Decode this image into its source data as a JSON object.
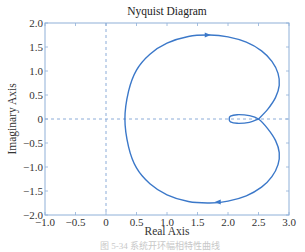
{
  "chart_data": {
    "type": "line",
    "title": "Nyquist Diagram",
    "xlabel": "Real Axis",
    "ylabel": "Imaginary Axis",
    "xlim": [
      -1.0,
      3.0
    ],
    "ylim": [
      -2.0,
      2.0
    ],
    "xticks": [
      -1.0,
      -0.5,
      0,
      0.5,
      1.0,
      1.5,
      2.0,
      2.5,
      3.0
    ],
    "xtick_labels": [
      "−1.0",
      "−0.5",
      "0",
      "0.5",
      "1.0",
      "1.5",
      "2.0",
      "2.5",
      "3.0"
    ],
    "yticks": [
      2.0,
      1.5,
      1.0,
      0.5,
      0,
      -0.5,
      -1.0,
      -1.5,
      -2.0
    ],
    "ytick_labels": [
      "2.0",
      "1.5",
      "1.0",
      "0.5",
      "0",
      "−0.5",
      "−1.0",
      "−1.5",
      "−2.0"
    ],
    "grid": false,
    "reference_lines": [
      {
        "orientation": "vertical",
        "value": 0,
        "style": "dashed"
      },
      {
        "orientation": "horizontal",
        "value": 0,
        "style": "dashed"
      }
    ],
    "series": [
      {
        "name": "Nyquist curve",
        "color": "#3b78c9",
        "x": [
          2.5,
          2.65,
          2.78,
          2.84,
          2.82,
          2.72,
          2.55,
          2.3,
          2.0,
          1.7,
          1.35,
          1.0,
          0.72,
          0.5,
          0.37,
          0.31,
          0.37,
          0.5,
          0.72,
          1.0,
          1.35,
          1.7,
          2.0,
          2.3,
          2.55,
          2.72,
          2.82,
          2.84,
          2.78,
          2.65,
          2.5,
          2.35,
          2.15,
          2.04,
          2.02,
          2.04,
          2.15,
          2.35,
          2.5
        ],
        "y": [
          0.0,
          0.2,
          0.45,
          0.7,
          0.95,
          1.2,
          1.42,
          1.6,
          1.71,
          1.75,
          1.72,
          1.58,
          1.35,
          1.02,
          0.58,
          0.0,
          -0.58,
          -1.02,
          -1.35,
          -1.58,
          -1.72,
          -1.75,
          -1.71,
          -1.6,
          -1.42,
          -1.2,
          -0.95,
          -0.7,
          -0.45,
          -0.2,
          0.0,
          0.07,
          0.09,
          0.06,
          0.0,
          -0.06,
          -0.09,
          -0.07,
          0.0
        ],
        "arrows": [
          {
            "x": 1.66,
            "y": 1.75,
            "direction": "right"
          },
          {
            "x": 1.84,
            "y": -1.73,
            "direction": "left"
          }
        ]
      }
    ]
  },
  "caption": "图 5-34 系统开环幅相特性曲线"
}
